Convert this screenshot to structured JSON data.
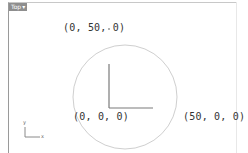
{
  "viewport": {
    "view_name": "Top",
    "view_menu_icon": "dropdown-arrow-icon"
  },
  "scene": {
    "circle": {
      "center": [
        125,
        97
      ],
      "radius_px": 52,
      "stroke": "#c8c8c8"
    },
    "axes_stroke": "#777777"
  },
  "labels": {
    "top_point": "(0, 50, 0)",
    "origin_point": "(0, 0, 0)",
    "right_point": "(50, 0, 0)"
  },
  "gizmo": {
    "y_label": "y",
    "x_label": "x"
  }
}
